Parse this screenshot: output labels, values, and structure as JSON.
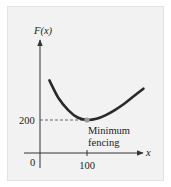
{
  "chart_data": {
    "type": "line",
    "title": "",
    "ylabel": "F(x)",
    "xlabel": "x",
    "origin_label": "0",
    "x_ticks": [
      {
        "value": 100,
        "label": "100"
      }
    ],
    "y_ticks": [
      {
        "value": 200,
        "label": "200"
      }
    ],
    "xlim": [
      0,
      240
    ],
    "ylim": [
      0,
      480
    ],
    "series": [
      {
        "name": "F(x)",
        "points": [
          [
            20,
            440
          ],
          [
            40,
            330
          ],
          [
            60,
            260
          ],
          [
            80,
            215
          ],
          [
            100,
            200
          ],
          [
            120,
            207
          ],
          [
            140,
            230
          ],
          [
            160,
            262
          ],
          [
            180,
            300
          ],
          [
            200,
            345
          ],
          [
            220,
            390
          ]
        ]
      }
    ],
    "highlight_point": {
      "x": 100,
      "y": 200,
      "color": "#9a9a9a"
    },
    "annotation": {
      "line1": "Minimum",
      "line2": "fencing"
    },
    "curve_color": "#2a2a2a",
    "axis_color": "#333333"
  }
}
